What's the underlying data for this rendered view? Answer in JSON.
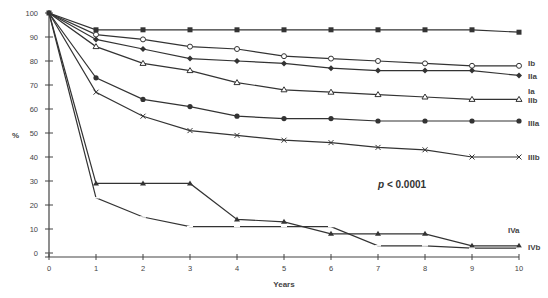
{
  "chart_data": {
    "type": "line",
    "title": "",
    "xlabel": "Years",
    "ylabel": "%",
    "xlim": [
      0,
      10
    ],
    "ylim": [
      0,
      100
    ],
    "x": [
      0,
      1,
      2,
      3,
      4,
      5,
      6,
      7,
      8,
      9,
      10
    ],
    "x_ticks": [
      "0",
      "1",
      "2",
      "3",
      "4",
      "5",
      "6",
      "7",
      "8",
      "9",
      "10"
    ],
    "y_ticks": [
      "0",
      "10",
      "20",
      "30",
      "40",
      "50",
      "60",
      "70",
      "80",
      "90",
      "100"
    ],
    "grid": false,
    "legend_position": "inline-right",
    "annotation": "p < 0.0001",
    "series": [
      {
        "name": "Ia",
        "marker": "filled-square",
        "values": [
          100,
          93,
          93,
          93,
          93,
          93,
          93,
          93,
          93,
          93,
          92
        ]
      },
      {
        "name": "Ib",
        "marker": "open-circle",
        "values": [
          100,
          91,
          89,
          86,
          85,
          82,
          81,
          80,
          79,
          78,
          78
        ]
      },
      {
        "name": "IIa",
        "marker": "filled-diamond",
        "values": [
          100,
          89,
          85,
          81,
          80,
          79,
          77,
          76,
          76,
          76,
          74
        ]
      },
      {
        "name": "IIb",
        "marker": "open-triangle",
        "values": [
          100,
          86,
          79,
          76,
          71,
          68,
          67,
          66,
          65,
          64,
          64
        ]
      },
      {
        "name": "IIIa",
        "marker": "filled-circle",
        "values": [
          100,
          73,
          64,
          61,
          57,
          56,
          56,
          55,
          55,
          55,
          55
        ]
      },
      {
        "name": "IIIb",
        "marker": "cross",
        "values": [
          100,
          67,
          57,
          51,
          49,
          47,
          46,
          44,
          43,
          40,
          40
        ]
      },
      {
        "name": "IVa",
        "marker": "filled-triangle",
        "values": [
          100,
          29,
          29,
          29,
          14,
          13,
          8,
          8,
          8,
          3,
          3
        ]
      },
      {
        "name": "IVb",
        "marker": "dash",
        "values": [
          100,
          23,
          15,
          11,
          11,
          11,
          11,
          3,
          3,
          2,
          2
        ]
      }
    ]
  },
  "labels": {
    "y_axis_title": "%",
    "x_axis_title": "Years",
    "p_value_prefix": "p",
    "p_value_rest": " < 0.0001"
  }
}
